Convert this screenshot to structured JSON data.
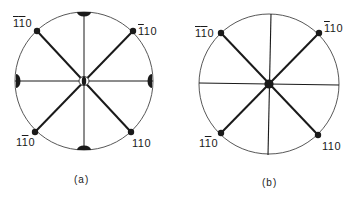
{
  "figure": {
    "panels": [
      {
        "id": "a",
        "caption": "(a)",
        "labels": {
          "top_left": {
            "digits": [
              "1",
              "1",
              "0"
            ],
            "overline": [
              true,
              true,
              false
            ]
          },
          "top_right": {
            "digits": [
              "1",
              "1",
              "0"
            ],
            "overline": [
              true,
              false,
              false
            ]
          },
          "bottom_left": {
            "digits": [
              "1",
              "1",
              "0"
            ],
            "overline": [
              false,
              true,
              false
            ]
          },
          "bottom_right": {
            "digits": [
              "1",
              "1",
              "0"
            ],
            "overline": [
              false,
              false,
              false
            ]
          }
        },
        "center_marker": "split-ellipse",
        "rim_markers": [
          "top",
          "bottom",
          "left",
          "right"
        ]
      },
      {
        "id": "b",
        "caption": "(b)",
        "labels": {
          "top_left": {
            "digits": [
              "1",
              "1",
              "0"
            ],
            "overline": [
              true,
              true,
              false
            ]
          },
          "top_right": {
            "digits": [
              "1",
              "1",
              "0"
            ],
            "overline": [
              true,
              false,
              false
            ]
          },
          "bottom_left": {
            "digits": [
              "1",
              "1",
              "0"
            ],
            "overline": [
              false,
              true,
              false
            ]
          },
          "bottom_right": {
            "digits": [
              "1",
              "1",
              "0"
            ],
            "overline": [
              false,
              false,
              false
            ]
          }
        },
        "center_marker": "filled-dot",
        "rim_markers": []
      }
    ],
    "colors": {
      "line": "#1a1a1a",
      "background": "#ffffff"
    }
  }
}
